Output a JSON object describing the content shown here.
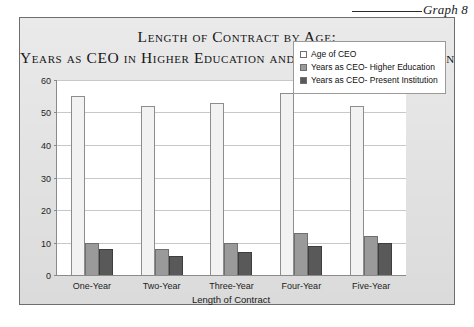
{
  "caption": {
    "label": "Graph 8"
  },
  "title": {
    "line1": "Length of Contract by Age;",
    "line2": "Years as CEO in Higher Education and at Present Institution"
  },
  "legend": {
    "items": [
      {
        "label": "Age of CEO",
        "color": "#ffffff",
        "swatch": "s0"
      },
      {
        "label": "Years as CEO- Higher Education",
        "color": "#9a9a9a",
        "swatch": "s1"
      },
      {
        "label": "Years as CEO- Present Institution",
        "color": "#595959",
        "swatch": "s2"
      }
    ]
  },
  "axes": {
    "y_ticks": [
      "0",
      "10",
      "20",
      "30",
      "40",
      "50",
      "60"
    ],
    "x_title": "Length of Contract"
  },
  "chart_data": {
    "type": "bar",
    "title": "Length of Contract by Age; Years as CEO in Higher Education and at Present Institution",
    "xlabel": "Length of Contract",
    "ylabel": "",
    "ylim": [
      0,
      60
    ],
    "ytick_step": 10,
    "grid": true,
    "legend_position": "top-right-inside",
    "categories": [
      "One-Year",
      "Two-Year",
      "Three-Year",
      "Four-Year",
      "Five-Year"
    ],
    "series": [
      {
        "name": "Age of CEO",
        "color": "#ffffff",
        "values": [
          55,
          52,
          53,
          56,
          52
        ]
      },
      {
        "name": "Years as CEO- Higher Education",
        "color": "#9a9a9a",
        "values": [
          10,
          8,
          10,
          13,
          12
        ]
      },
      {
        "name": "Years as CEO- Present Institution",
        "color": "#595959",
        "values": [
          8,
          6,
          7,
          9,
          10
        ]
      }
    ]
  }
}
